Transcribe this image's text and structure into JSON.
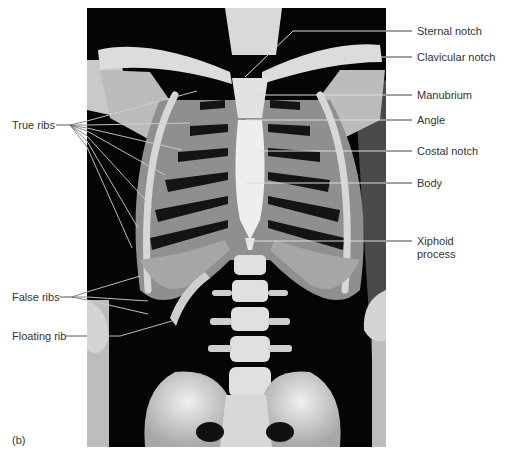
{
  "figure": {
    "panel_label": "(b)",
    "background": "#ffffff",
    "photo": {
      "subject": "anterior view of human thoracic cage skeleton",
      "background_color": "#050505",
      "bone_color": "#cfcfcf",
      "x": 87,
      "y": 8,
      "width": 299,
      "height": 439
    },
    "leader_line_color": "#d8d8d8",
    "leader_line_outside_color": "#555555"
  },
  "labels_right": [
    {
      "id": "sternal-notch",
      "text": "Sternal notch"
    },
    {
      "id": "clavicular-notch",
      "text": "Clavicular notch"
    },
    {
      "id": "manubrium",
      "text": "Manubrium"
    },
    {
      "id": "angle",
      "text": "Angle"
    },
    {
      "id": "costal-notch",
      "text": "Costal notch"
    },
    {
      "id": "body",
      "text": "Body"
    },
    {
      "id": "xiphoid-process",
      "text_line1": "Xiphoid",
      "text_line2": "process"
    }
  ],
  "labels_left": [
    {
      "id": "true-ribs",
      "text": "True ribs"
    },
    {
      "id": "false-ribs",
      "text": "False ribs"
    },
    {
      "id": "floating-rib",
      "text": "Floating rib"
    }
  ]
}
